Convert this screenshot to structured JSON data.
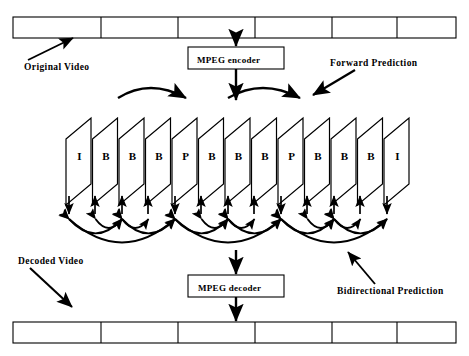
{
  "diagram": {
    "stroke_color": "#000000",
    "background_color": "#ffffff"
  },
  "top_strip": {
    "name": "original-video-strip",
    "segments": 6,
    "x": 13,
    "y": 17,
    "width": 443,
    "height": 21,
    "dividers": [
      88,
      165,
      242,
      319,
      384
    ]
  },
  "bottom_strip": {
    "name": "decoded-video-strip",
    "segments": 6,
    "x": 13,
    "y": 322,
    "width": 443,
    "height": 21,
    "dividers": [
      88,
      165,
      242,
      319,
      384
    ]
  },
  "encoder_box": {
    "label": "MPEG encoder",
    "x": 188,
    "y": 47,
    "width": 96,
    "height": 22
  },
  "decoder_box": {
    "label": "MPEG decoder",
    "x": 188,
    "y": 275,
    "width": 96,
    "height": 22
  },
  "labels": {
    "original_video": "Original  Video",
    "forward_prediction": "Forward   Prediction",
    "decoded_video": "Decoded  Video",
    "bidirectional_prediction": "Bidirectional  Prediction"
  },
  "frames": {
    "count": 13,
    "sequence": [
      "I",
      "B",
      "B",
      "B",
      "P",
      "B",
      "B",
      "B",
      "P",
      "B",
      "B",
      "B",
      "I"
    ],
    "start_x": 66,
    "pitch": 26.5,
    "top_y": 118,
    "bottom_y": 184,
    "face_width": 25,
    "slant": 21,
    "label_y": 157
  },
  "forward_arcs": [
    {
      "x1": 118,
      "y1": 98,
      "cx": 150,
      "cy": 78,
      "x2": 186,
      "y2": 98
    },
    {
      "x1": 228,
      "y1": 98,
      "cx": 262,
      "cy": 78,
      "x2": 300,
      "y2": 98
    }
  ],
  "vertical_arrows": [
    {
      "x": 69,
      "direction": "down"
    },
    {
      "x": 95,
      "direction": "up"
    },
    {
      "x": 122,
      "direction": "up"
    },
    {
      "x": 148,
      "direction": "up"
    },
    {
      "x": 175,
      "direction": "down"
    },
    {
      "x": 201,
      "direction": "up"
    },
    {
      "x": 228,
      "direction": "up"
    },
    {
      "x": 254,
      "direction": "up"
    },
    {
      "x": 281,
      "direction": "down"
    },
    {
      "x": 307,
      "direction": "up"
    },
    {
      "x": 334,
      "direction": "up"
    },
    {
      "x": 360,
      "direction": "up"
    },
    {
      "x": 387,
      "direction": "down"
    }
  ],
  "bidirectional_arc_groups": [
    {
      "left": 69,
      "right": 175
    },
    {
      "left": 175,
      "right": 281
    },
    {
      "left": 281,
      "right": 387
    }
  ],
  "pointer_arrows": {
    "original_video": {
      "x1": 28,
      "y1": 60,
      "x2": 73,
      "y2": 38
    },
    "forward_prediction": {
      "x1": 355,
      "y1": 70,
      "x2": 313,
      "y2": 95
    },
    "decoded_video": {
      "x1": 30,
      "y1": 268,
      "x2": 72,
      "y2": 307
    },
    "bidirectional_prediction": {
      "x1": 375,
      "y1": 284,
      "x2": 348,
      "y2": 252
    },
    "encoder_in": {
      "x1": 236,
      "y1": 38,
      "x2": 236,
      "y2": 46
    },
    "encoder_out": {
      "x1": 236,
      "y1": 69,
      "x2": 236,
      "y2": 100
    },
    "decoder_in": {
      "x1": 236,
      "y1": 250,
      "x2": 236,
      "y2": 274
    },
    "decoder_out": {
      "x1": 236,
      "y1": 297,
      "x2": 236,
      "y2": 321
    }
  }
}
